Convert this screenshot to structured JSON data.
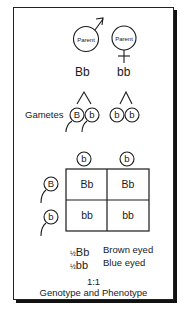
{
  "parents": {
    "male": {
      "label": "Parent",
      "symbol": "male-symbol",
      "genotype": "Bb"
    },
    "female": {
      "label": "Parent",
      "symbol": "female-symbol",
      "genotype": "bb"
    }
  },
  "gametes": {
    "label": "Gametes",
    "male": [
      "B",
      "b"
    ],
    "female": [
      "b",
      "b"
    ]
  },
  "punnett": {
    "column_headers": [
      "b",
      "b"
    ],
    "row_headers": [
      "B",
      "b"
    ],
    "cells": [
      [
        "Bb",
        "Bb"
      ],
      [
        "bb",
        "bb"
      ]
    ]
  },
  "results": [
    {
      "fraction": "½",
      "genotype": "Bb",
      "phenotype": "Brown eyed"
    },
    {
      "fraction": "½",
      "genotype": "bb",
      "phenotype": "Blue eyed"
    }
  ],
  "ratio": "1:1",
  "caption": "Genotype and Phenotype"
}
